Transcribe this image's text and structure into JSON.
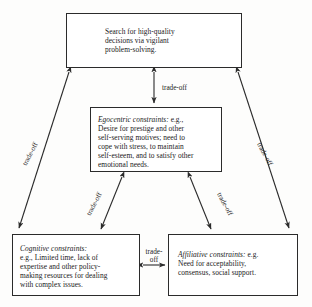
{
  "diagram": {
    "nodes": {
      "top": {
        "id": "search-high-quality-decisions",
        "lead": "",
        "body": "Search for high-quality\ndecisions via vigilant\nproblem-solving."
      },
      "egocentric": {
        "id": "egocentric-constraints",
        "lead": "Egocentric constraints:",
        "body": " e.g.,\nDesire for prestige and other\nself-serving motives; need to\ncope with stress, to maintain\nself-esteem, and to satisfy other\nemotional needs."
      },
      "cognitive": {
        "id": "cognitive-constraints",
        "lead": "Cognitive constraints:",
        "body": "\ne.g., Limited time, lack of\nexpertise and other policy-\nmaking resources for dealing\nwith complex issues."
      },
      "affiliative": {
        "id": "affiliative-constraints",
        "lead": "Affiliative constraints:",
        "body": " e.g.\nNeed for acceptability,\nconsensus, social support."
      }
    },
    "edges": {
      "top_to_egocentric": {
        "label": "trade-off",
        "direction": "bidirectional"
      },
      "top_to_cognitive": {
        "label": "trade-off",
        "direction": "bidirectional"
      },
      "top_to_affiliative": {
        "label": "trade-off",
        "direction": "bidirectional"
      },
      "egocentric_to_cognitive": {
        "label": "trade-off",
        "direction": "bidirectional"
      },
      "egocentric_to_affiliative": {
        "label": "trade-off",
        "direction": "bidirectional"
      },
      "cognitive_to_affiliative": {
        "label": "trade-\noff",
        "direction": "bidirectional"
      }
    },
    "style": {
      "line_color": "#2b2b2b",
      "box_border": "#2b2b2b",
      "background": "#fdfdfc",
      "text_color": "#1a1a1a"
    }
  }
}
